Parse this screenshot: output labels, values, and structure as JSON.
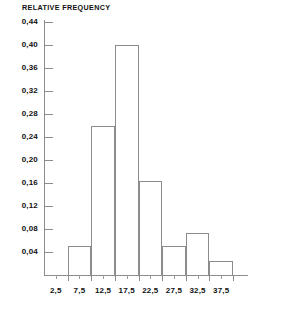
{
  "chart_data": {
    "type": "bar",
    "title": "RELATIVE FREQUENCY",
    "xlabel": "",
    "ylabel": "RELATIVE FREQUENCY",
    "categories": [
      "2,5",
      "7,5",
      "12,5",
      "17,5",
      "22,5",
      "27,5",
      "32,5",
      "37,5"
    ],
    "bin_edges": [
      0,
      5,
      10,
      15,
      20,
      25,
      30,
      35,
      40
    ],
    "values": [
      0.0,
      0.05,
      0.26,
      0.4,
      0.163,
      0.05,
      0.073,
      0.025
    ],
    "ylim": [
      0,
      0.44
    ],
    "xlim": [
      0,
      40
    ],
    "ytick_labels": [
      "0,04",
      "0,08",
      "0,12",
      "0,16",
      "0,20",
      "0,24",
      "0,28",
      "0,32",
      "0,36",
      "0,40",
      "0,44"
    ],
    "ytick_values": [
      0.04,
      0.08,
      0.12,
      0.16,
      0.2,
      0.24,
      0.28,
      0.32,
      0.36,
      0.4,
      0.44
    ],
    "grid": false,
    "legend": null,
    "colors": {
      "axis": "#8c8c8c",
      "bar_outline": "#8c8c8c",
      "bar_fill": "transparent",
      "text": "#111111",
      "background": "#ffffff"
    }
  }
}
